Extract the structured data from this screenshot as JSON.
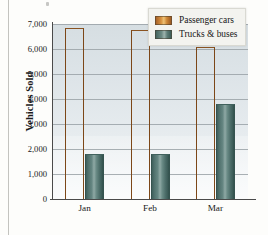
{
  "chart_data": {
    "type": "bar",
    "title": "",
    "xlabel": "",
    "ylabel": "Vehicles Sold",
    "categories": [
      "Jan",
      "Feb",
      "Mar"
    ],
    "series": [
      {
        "name": "Passenger cars",
        "color": "#d08a38",
        "values": [
          6850,
          6750,
          6100
        ]
      },
      {
        "name": "Trucks & buses",
        "color": "#5d7e79",
        "values": [
          1800,
          1820,
          3800
        ]
      }
    ],
    "ylim": [
      0,
      7000
    ],
    "ytick_labels": [
      "7,000",
      "6,000",
      "5,000",
      "4,000",
      "3,000",
      "2,000",
      "1,000",
      "0"
    ],
    "ytick_values": [
      7000,
      6000,
      5000,
      4000,
      3000,
      2000,
      1000,
      0
    ],
    "grid": true,
    "legend_position": "top-right",
    "plot_background": "#e2e8ec"
  },
  "axis": {
    "y_title": "Vehicles Sold"
  },
  "legend": {
    "items": [
      {
        "label": "Passenger cars"
      },
      {
        "label": "Trucks & buses"
      }
    ]
  }
}
